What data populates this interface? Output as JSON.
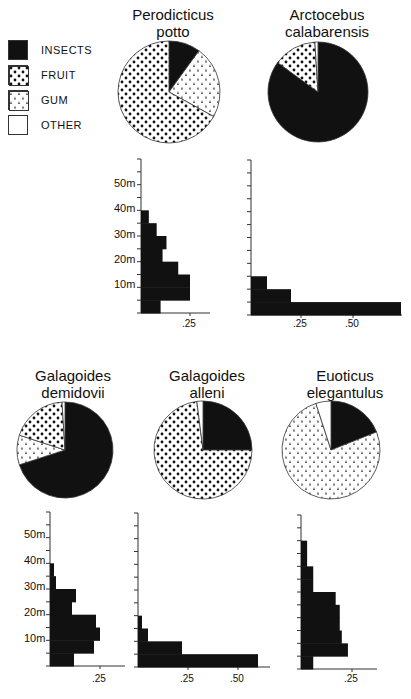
{
  "legend": [
    {
      "label": "INSECTS",
      "pattern": "solid"
    },
    {
      "label": "FRUIT",
      "pattern": "dots"
    },
    {
      "label": "GUM",
      "pattern": "drops"
    },
    {
      "label": "OTHER",
      "pattern": "empty"
    }
  ],
  "species": [
    {
      "name_line1": "Perodicticus",
      "name_line2": "potto"
    },
    {
      "name_line1": "Arctocebus",
      "name_line2": "calabarensis"
    },
    {
      "name_line1": "Galagoides",
      "name_line2": "demidovii"
    },
    {
      "name_line1": "Galagoides",
      "name_line2": "alleni"
    },
    {
      "name_line1": "Euoticus",
      "name_line2": "elegantulus"
    }
  ],
  "axis_labels": {
    "y": [
      "10m",
      "20m",
      "30m",
      "40m",
      "50m"
    ],
    "x25": ".25",
    "x50": ".50"
  },
  "chart_data": [
    {
      "type": "pie",
      "title": "Perodicticus potto",
      "categories": [
        "INSECTS",
        "GUM",
        "FRUIT",
        "OTHER"
      ],
      "values": [
        10,
        23,
        67,
        0
      ]
    },
    {
      "type": "pie",
      "title": "Arctocebus calabarensis",
      "categories": [
        "INSECTS",
        "FRUIT",
        "OTHER"
      ],
      "values": [
        85,
        14,
        1
      ]
    },
    {
      "type": "bar",
      "orientation": "horizontal",
      "title": "Perodicticus potto height distribution",
      "xlabel": "proportion",
      "ylabel": "height (m)",
      "categories": [
        "0-5m",
        "5-10m",
        "10-15m",
        "15-20m",
        "20-25m",
        "25-30m",
        "30-35m",
        "35-40m"
      ],
      "values": [
        0.1,
        0.25,
        0.25,
        0.19,
        0.11,
        0.13,
        0.08,
        0.04
      ],
      "ylim": [
        0,
        60
      ],
      "xticks": [
        0.25
      ]
    },
    {
      "type": "bar",
      "orientation": "horizontal",
      "title": "Arctocebus calabarensis height distribution",
      "xlabel": "proportion",
      "ylabel": "height (m)",
      "categories": [
        "0-5m",
        "5-10m",
        "10-15m"
      ],
      "values": [
        0.75,
        0.2,
        0.08
      ],
      "ylim": [
        0,
        60
      ],
      "xticks": [
        0.25,
        0.5
      ]
    },
    {
      "type": "pie",
      "title": "Galagoides demidovii",
      "categories": [
        "INSECTS",
        "GUM",
        "FRUIT",
        "OTHER"
      ],
      "values": [
        70,
        10,
        19,
        1
      ]
    },
    {
      "type": "pie",
      "title": "Galagoides alleni",
      "categories": [
        "INSECTS",
        "FRUIT",
        "OTHER"
      ],
      "values": [
        25,
        73,
        2
      ]
    },
    {
      "type": "pie",
      "title": "Euoticus elegantulus",
      "categories": [
        "INSECTS",
        "GUM",
        "OTHER"
      ],
      "values": [
        19,
        76,
        5
      ]
    },
    {
      "type": "bar",
      "orientation": "horizontal",
      "title": "Galagoides demidovii height distribution",
      "xlabel": "proportion",
      "ylabel": "height (m)",
      "categories": [
        "0-5m",
        "5-10m",
        "10-15m",
        "15-20m",
        "20-25m",
        "25-30m",
        "30-35m",
        "35-40m"
      ],
      "values": [
        0.12,
        0.22,
        0.25,
        0.23,
        0.11,
        0.13,
        0.03,
        0.02
      ],
      "ylim": [
        0,
        60
      ],
      "xticks": [
        0.25
      ]
    },
    {
      "type": "bar",
      "orientation": "horizontal",
      "title": "Galagoides alleni height distribution",
      "xlabel": "proportion",
      "ylabel": "height (m)",
      "categories": [
        "0-5m",
        "5-10m",
        "10-15m",
        "15-20m"
      ],
      "values": [
        0.6,
        0.22,
        0.05,
        0.02
      ],
      "ylim": [
        0,
        60
      ],
      "xticks": [
        0.25,
        0.5
      ]
    },
    {
      "type": "bar",
      "orientation": "horizontal",
      "title": "Euoticus elegantulus height distribution",
      "xlabel": "proportion",
      "ylabel": "height (m)",
      "categories": [
        "0-5m",
        "5-10m",
        "10-15m",
        "15-20m",
        "20-25m",
        "25-30m",
        "30-35m",
        "35-40m",
        "40-45m",
        "45-50m"
      ],
      "values": [
        0.06,
        0.23,
        0.2,
        0.19,
        0.19,
        0.17,
        0.06,
        0.06,
        0.03,
        0.03
      ],
      "ylim": [
        0,
        60
      ],
      "xticks": [
        0.25
      ]
    }
  ]
}
